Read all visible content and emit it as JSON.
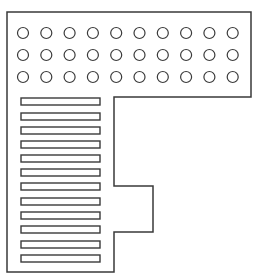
{
  "diagram": {
    "stroke_color": "#3a3a3a",
    "background": "#ffffff",
    "outline": {
      "points": [
        [
          7,
          12
        ],
        [
          251,
          12
        ],
        [
          251,
          97
        ],
        [
          114,
          97
        ],
        [
          114,
          186
        ],
        [
          153,
          186
        ],
        [
          153,
          232
        ],
        [
          114,
          232
        ],
        [
          114,
          272
        ],
        [
          7,
          272
        ]
      ]
    },
    "circles": {
      "rows": 3,
      "cols": 10,
      "start_x": 23,
      "start_y": 33,
      "dx": 23.3,
      "dy": 22,
      "radius": 5.5
    },
    "bars": {
      "count": 12,
      "x": 21,
      "width": 79,
      "height": 7,
      "tops": [
        98,
        113,
        127,
        141,
        155,
        169,
        183,
        198,
        212,
        226,
        241,
        255
      ]
    }
  }
}
